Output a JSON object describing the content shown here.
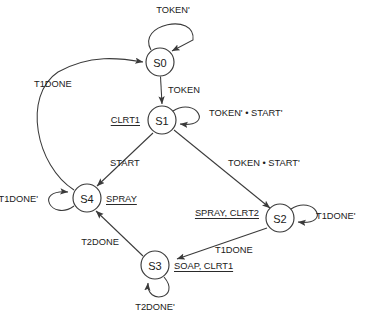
{
  "diagram": {
    "type": "state-transition-diagram",
    "background_color": "#ffffff",
    "line_color": "#3a3a3a",
    "text_color": "#1a1a1a"
  },
  "states": [
    {
      "id": "S0",
      "label": "S0",
      "cx": 160,
      "cy": 62,
      "r": 14,
      "output": ""
    },
    {
      "id": "S1",
      "label": "S1",
      "cx": 162,
      "cy": 120,
      "r": 14,
      "output": "CLRT1"
    },
    {
      "id": "S2",
      "label": "S2",
      "cx": 280,
      "cy": 218,
      "r": 14,
      "output": "SPRAY, CLRT2"
    },
    {
      "id": "S3",
      "label": "S3",
      "cx": 155,
      "cy": 265,
      "r": 14,
      "output": "SOAP, CLRT1"
    },
    {
      "id": "S4",
      "label": "S4",
      "cx": 87,
      "cy": 198,
      "r": 14,
      "output": "SPRAY"
    }
  ],
  "state_outputs": [
    {
      "state": "S1",
      "text": "CLRT1",
      "x": 140,
      "y": 120,
      "align": "end"
    },
    {
      "state": "S4",
      "text": "SPRAY",
      "x": 106,
      "y": 199,
      "align": "start"
    },
    {
      "state": "S2",
      "text": "SPRAY, CLRT2",
      "x": 259,
      "y": 213,
      "align": "end"
    },
    {
      "state": "S3",
      "text": "SOAP, CLRT1",
      "x": 174,
      "y": 266,
      "align": "start"
    }
  ],
  "transitions": [
    {
      "from": "S0",
      "to": "S0",
      "label": "TOKEN'",
      "kind": "self",
      "label_x": 173,
      "label_y": 10
    },
    {
      "from": "S0",
      "to": "S1",
      "label": "TOKEN",
      "kind": "edge",
      "label_x": 168,
      "label_y": 90
    },
    {
      "from": "S1",
      "to": "S1",
      "label": "TOKEN' • START'",
      "kind": "self",
      "label_x": 209,
      "label_y": 113
    },
    {
      "from": "S1",
      "to": "S4",
      "label": "START",
      "kind": "edge",
      "label_x": 110,
      "label_y": 163
    },
    {
      "from": "S1",
      "to": "S2",
      "label": "TOKEN • START'",
      "kind": "edge",
      "label_x": 228,
      "label_y": 163
    },
    {
      "from": "S2",
      "to": "S2",
      "label": "T1DONE'",
      "kind": "self",
      "label_x": 316,
      "label_y": 216
    },
    {
      "from": "S2",
      "to": "S3",
      "label": "T1DONE",
      "kind": "edge",
      "label_x": 215,
      "label_y": 250
    },
    {
      "from": "S3",
      "to": "S3",
      "label": "T2DONE'",
      "kind": "self",
      "label_x": 155,
      "label_y": 307
    },
    {
      "from": "S3",
      "to": "S4",
      "label": "T2DONE",
      "kind": "edge",
      "label_x": 100,
      "label_y": 242
    },
    {
      "from": "S4",
      "to": "S4",
      "label": "T1DONE'",
      "kind": "self",
      "label_x": 38,
      "label_y": 199
    },
    {
      "from": "S4",
      "to": "S0",
      "label": "T1DONE",
      "kind": "edge",
      "label_x": 57,
      "label_y": 84
    }
  ]
}
